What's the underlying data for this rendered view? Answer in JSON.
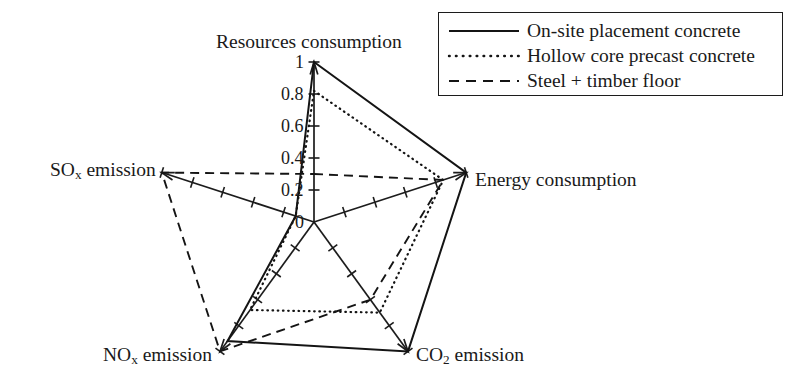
{
  "chart_data": {
    "type": "radar",
    "title": "",
    "subtitle": "",
    "xlabel": "",
    "ylabel": "",
    "categories": [
      "Resources consumption",
      "Energy consumption",
      "CO2 emission",
      "NOx emission",
      "SOx emission"
    ],
    "category_labels_display": [
      "Resources consumption",
      "Energy consumption",
      "CO₂ emission",
      "NOₓ emission",
      "SOₓ emission"
    ],
    "radial_range": [
      0,
      1
    ],
    "radial_ticks": [
      "0",
      "0.2",
      "0.4",
      "0.6",
      "0.8",
      "1"
    ],
    "radial_tick_values": [
      0,
      0.2,
      0.4,
      0.6,
      0.8,
      1
    ],
    "grid": false,
    "legend_position": "top-right",
    "series": [
      {
        "name": "On-site placement concrete",
        "style": "solid",
        "values": [
          1.0,
          1.0,
          1.0,
          0.92,
          0.12
        ]
      },
      {
        "name": "Hollow core precast concrete",
        "style": "dotted",
        "values": [
          0.82,
          0.85,
          0.7,
          0.68,
          0.12
        ]
      },
      {
        "name": "Steel + timber floor",
        "style": "dashed",
        "values": [
          0.3,
          0.85,
          0.6,
          1.0,
          1.0
        ]
      }
    ]
  },
  "axis_labels": {
    "resources": "Resources consumption",
    "energy": "Energy consumption",
    "co2_prefix": "CO",
    "co2_sub": "2",
    "co2_suffix": " emission",
    "nox_prefix": "NO",
    "nox_sub": "x",
    "nox_suffix": " emission",
    "sox_prefix": "SO",
    "sox_sub": "x",
    "sox_suffix": " emission"
  },
  "tick_labels": {
    "t1": "1",
    "t08": "0.8",
    "t06": "0.6",
    "t04": "0.4",
    "t02": "0.2",
    "t0": "0"
  },
  "legend": {
    "items": [
      {
        "label": "On-site placement concrete",
        "style": "solid"
      },
      {
        "label": "Hollow core precast concrete",
        "style": "dotted"
      },
      {
        "label": "Steel + timber floor",
        "style": "dashed"
      }
    ]
  },
  "colors": {
    "ink": "#141414",
    "background": "#ffffff"
  }
}
